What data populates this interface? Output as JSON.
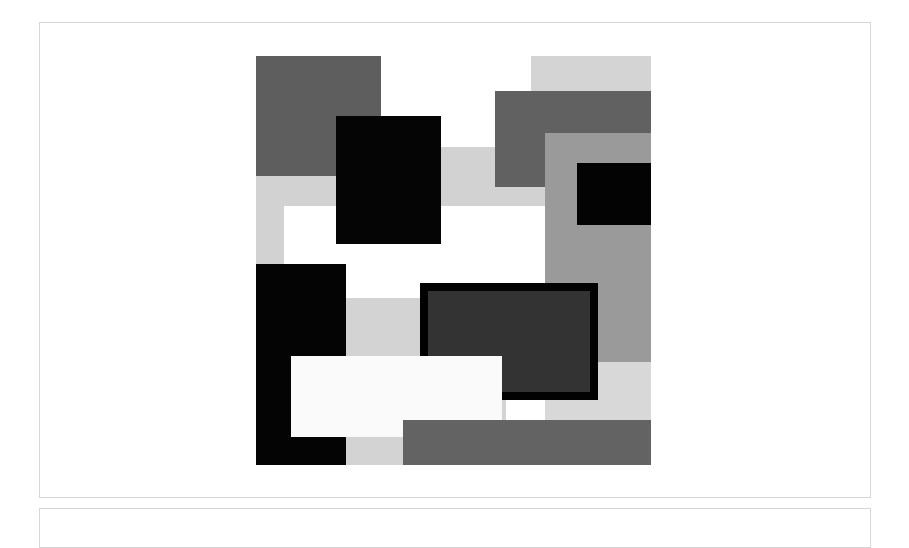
{
  "artwork": {
    "description": "Abstract grayscale composition of overlapping rectangles",
    "origin": [
      256,
      56
    ],
    "size": [
      395,
      409
    ],
    "shapes": [
      {
        "name": "light-band-left-column",
        "x": 0,
        "y": 120,
        "w": 28,
        "h": 88,
        "fill": "#d2d2d2"
      },
      {
        "name": "light-band-horizontal",
        "x": 0,
        "y": 91,
        "w": 289,
        "h": 59,
        "fill": "#d2d2d2"
      },
      {
        "name": "light-top-right",
        "x": 275,
        "y": 0,
        "w": 120,
        "h": 40,
        "fill": "#d4d4d4"
      },
      {
        "name": "dark-gray-top-left",
        "x": 0,
        "y": 0,
        "w": 125,
        "h": 120,
        "fill": "#5e5e5e"
      },
      {
        "name": "black-square-top",
        "x": 80,
        "y": 60,
        "w": 105,
        "h": 128,
        "fill": "#050505"
      },
      {
        "name": "dark-gray-top-right",
        "x": 239,
        "y": 35,
        "w": 156,
        "h": 96,
        "fill": "#616161"
      },
      {
        "name": "medium-gray-right",
        "x": 289,
        "y": 77,
        "w": 106,
        "h": 229,
        "fill": "#9a9a9a"
      },
      {
        "name": "black-rect-right",
        "x": 321,
        "y": 107,
        "w": 74,
        "h": 62,
        "fill": "#030303"
      },
      {
        "name": "light-lower-right",
        "x": 289,
        "y": 306,
        "w": 106,
        "h": 58,
        "fill": "#d8d8d8"
      },
      {
        "name": "light-middle",
        "x": 90,
        "y": 242,
        "w": 160,
        "h": 167,
        "fill": "#d3d3d3"
      },
      {
        "name": "black-column-left",
        "x": 0,
        "y": 208,
        "w": 90,
        "h": 201,
        "fill": "#040404"
      },
      {
        "name": "bordered-dark-rect",
        "x": 164,
        "y": 227,
        "w": 178,
        "h": 117,
        "fill": "#333333",
        "border": "#020202",
        "border_width": 8
      },
      {
        "name": "white-rect",
        "x": 35,
        "y": 300,
        "w": 211,
        "h": 81,
        "fill": "#fafafa"
      },
      {
        "name": "dark-gray-bottom-bar",
        "x": 147,
        "y": 364,
        "w": 248,
        "h": 45,
        "fill": "#636363"
      }
    ]
  }
}
